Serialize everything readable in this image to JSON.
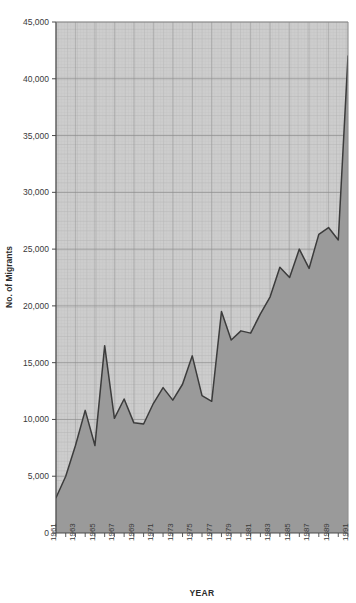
{
  "chart_data": {
    "type": "area",
    "title": "",
    "xlabel": "YEAR",
    "ylabel": "No. of Migrants",
    "xlim": [
      1961,
      1991
    ],
    "ylim": [
      0,
      45000
    ],
    "grid": true,
    "legend": null,
    "y_ticks": [
      0,
      5000,
      10000,
      15000,
      20000,
      25000,
      30000,
      35000,
      40000,
      45000
    ],
    "y_tick_labels": [
      "0",
      "5,000",
      "10,000",
      "15,000",
      "20,000",
      "25,000",
      "30,000",
      "35,000",
      "40,000",
      "45,000"
    ],
    "x_ticks": [
      1961,
      1963,
      1965,
      1967,
      1969,
      1971,
      1973,
      1975,
      1977,
      1979,
      1981,
      1983,
      1985,
      1987,
      1989,
      1991
    ],
    "x_tick_labels": [
      "1961",
      "1963",
      "1965",
      "1967",
      "1969",
      "1971",
      "1973",
      "1975",
      "1977",
      "1979",
      "1981",
      "1983",
      "1985",
      "1987",
      "1989",
      "1991"
    ],
    "x": [
      1961,
      1962,
      1963,
      1964,
      1965,
      1966,
      1967,
      1968,
      1969,
      1970,
      1971,
      1972,
      1973,
      1974,
      1975,
      1976,
      1977,
      1978,
      1979,
      1980,
      1981,
      1982,
      1983,
      1984,
      1985,
      1986,
      1987,
      1988,
      1989,
      1990,
      1991
    ],
    "values": [
      3100,
      5000,
      7700,
      10800,
      7700,
      16500,
      10100,
      11800,
      9700,
      9600,
      11400,
      12800,
      11700,
      13100,
      15600,
      12100,
      11600,
      19500,
      17000,
      17800,
      17600,
      19300,
      20800,
      23400,
      22500,
      25000,
      23300,
      26300,
      26900,
      25800,
      42000
    ],
    "series": [
      {
        "name": "No. of Migrants",
        "values": [
          3100,
          5000,
          7700,
          10800,
          7700,
          16500,
          10100,
          11800,
          9700,
          9600,
          11400,
          12800,
          11700,
          13100,
          15600,
          12100,
          11600,
          19500,
          17000,
          17800,
          17600,
          19300,
          20800,
          23400,
          22500,
          25000,
          23300,
          26300,
          26900,
          25800,
          42000
        ]
      }
    ],
    "colors": {
      "fill": "#9a9a9a",
      "line": "#3c3c3c",
      "plot_background": "#cdcdcd",
      "major_grid": "#8c8c8c",
      "minor_grid": "#bdbdbd",
      "axis": "#4a4a4a",
      "text": "#3a3a3a"
    }
  }
}
